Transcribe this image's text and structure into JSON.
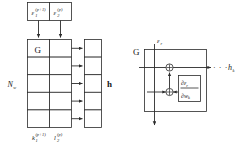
{
  "figure": {
    "panels": [
      "left-array-panel",
      "right-detail-panel"
    ],
    "colors": {
      "background": "#ffffff",
      "stroke": "#2b2b2b",
      "text": "#161616"
    }
  },
  "left_panel": {
    "input_boxes": [
      {
        "base": "ε",
        "sub": "1",
        "sup": "(p+1)"
      },
      {
        "base": "ε",
        "sub": "2",
        "sup": "(p)"
      }
    ],
    "output_labels": [
      {
        "base": "k",
        "sub": "1",
        "sup": "(p+1)"
      },
      {
        "base": "l",
        "sub": "2",
        "sup": "(p)"
      }
    ],
    "grid": {
      "rows": 5,
      "cols": 2,
      "first_cell_label": "G"
    },
    "output_column": {
      "rows": 5,
      "label": "h"
    },
    "side_label": {
      "base": "N",
      "sub": "w"
    },
    "arrow_count_between_columns": 5,
    "input_arrow_count": 2
  },
  "right_panel": {
    "block_label": "G",
    "input_label": {
      "base": "ε",
      "sub": "r"
    },
    "output_label": {
      "base": "h",
      "sub": "k"
    },
    "ellipsis": "· · ·",
    "sum_nodes": [
      {
        "name": "upper-sum-node",
        "glyph": "⊕"
      },
      {
        "name": "lower-sum-node",
        "glyph": "⊕"
      }
    ],
    "derivative_box": {
      "numerator": {
        "d": "∂",
        "base": "ε",
        "sub": "r"
      },
      "denominator": {
        "d": "∂",
        "base": "w",
        "sub": "k"
      }
    }
  }
}
